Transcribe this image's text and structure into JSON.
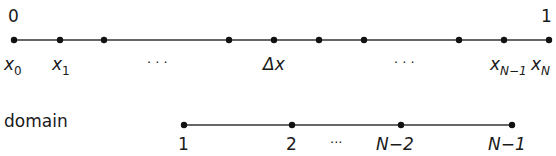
{
  "top_axis": {
    "start_label": "0",
    "end_label": "1",
    "points": [
      14,
      60,
      104,
      229,
      274,
      319,
      364,
      459,
      504,
      549
    ],
    "labels": {
      "x0": {
        "base": "x",
        "sub": "0"
      },
      "x1": {
        "base": "x",
        "sub": "1"
      },
      "dots_left": "· · ·",
      "delta_x": "Δx",
      "dots_right": "· · ·",
      "xN1": {
        "base": "x",
        "sub": "N−1"
      },
      "xN": {
        "base": "x",
        "sub": "N"
      }
    }
  },
  "bottom_axis": {
    "title": "domain",
    "points": [
      184,
      292,
      401,
      512
    ],
    "labels": {
      "p1": "1",
      "p2": "2",
      "dots": "···",
      "pN2": "N−2",
      "pN1": "N−1"
    }
  }
}
